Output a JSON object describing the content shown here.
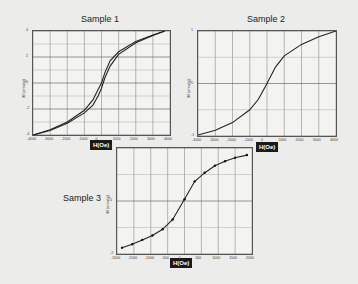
{
  "chart_data": [
    {
      "type": "line",
      "title": "Sample 1",
      "xlabel": "H(Oe)",
      "ylabel": "M (emu/g)",
      "xlim": [
        -4000,
        4000
      ],
      "ylim": [
        -4,
        4
      ],
      "xticks": [
        "-4000",
        "-3000",
        "-2000",
        "-1000",
        "0",
        "1000",
        "2000",
        "3000",
        "4000"
      ],
      "yticks": [
        "4",
        "2",
        "0",
        "-2",
        "-4"
      ],
      "grid": true,
      "series": [
        {
          "name": "ascending branch",
          "x": [
            -4000,
            -3000,
            -2000,
            -1000,
            -500,
            -200,
            0,
            200,
            500,
            1000,
            2000,
            3000,
            3700
          ],
          "y": [
            -4.0,
            -3.6,
            -3.0,
            -2.1,
            -1.3,
            -0.5,
            0.0,
            0.8,
            1.7,
            2.4,
            3.2,
            3.7,
            4.0
          ]
        },
        {
          "name": "descending branch",
          "x": [
            -4000,
            -3000,
            -2000,
            -1000,
            -500,
            -200,
            0,
            200,
            500,
            1000,
            2000,
            3000,
            3700
          ],
          "y": [
            -4.0,
            -3.65,
            -3.1,
            -2.3,
            -1.7,
            -1.0,
            -0.4,
            0.4,
            1.3,
            2.2,
            3.1,
            3.65,
            4.0
          ]
        }
      ]
    },
    {
      "type": "line",
      "title": "Sample 2",
      "xlabel": "H(Oe)",
      "ylabel": "M (emu/g)",
      "xlim": [
        -4000,
        4000
      ],
      "ylim": [
        -1.1,
        1.1
      ],
      "xticks": [
        "-4000",
        "-3000",
        "-2000",
        "-1000",
        "0",
        "1000",
        "2000",
        "3000",
        "4000"
      ],
      "yticks": [
        "1",
        "0",
        "-1"
      ],
      "grid": true,
      "series": [
        {
          "name": "M vs H",
          "x": [
            -4000,
            -3000,
            -2000,
            -1000,
            -500,
            0,
            500,
            1000,
            2000,
            3000,
            4000
          ],
          "y": [
            -1.08,
            -0.98,
            -0.82,
            -0.55,
            -0.33,
            0.0,
            0.35,
            0.58,
            0.82,
            0.98,
            1.1
          ]
        }
      ]
    },
    {
      "type": "line",
      "title": "Sample 3",
      "xlabel": "H(Oe)",
      "ylabel": "M (emu/g)",
      "xlim": [
        -2000,
        2000
      ],
      "ylim": [
        -3,
        3
      ],
      "xticks": [
        "-2000",
        "-1500",
        "-1000",
        "-500",
        "0",
        "500",
        "1000",
        "1500",
        "2000"
      ],
      "yticks": [
        "2",
        "0",
        "-2"
      ],
      "grid": true,
      "series": [
        {
          "name": "M vs H",
          "x": [
            -1850,
            -1550,
            -1250,
            -950,
            -650,
            -350,
            0,
            300,
            600,
            900,
            1200,
            1500,
            1850
          ],
          "y": [
            -2.65,
            -2.45,
            -2.2,
            -1.95,
            -1.6,
            -1.05,
            0.1,
            1.1,
            1.6,
            2.0,
            2.25,
            2.45,
            2.6
          ]
        }
      ]
    }
  ],
  "panels": [
    {
      "title": "Sample 1",
      "ylabel": "M (emu/g)",
      "xbadge": "H(Oe)",
      "xticks": [
        "-4000",
        "-3000",
        "-2000",
        "-1000",
        "0",
        "1000",
        "2000",
        "3000",
        "4000"
      ],
      "yticks": [
        "4",
        "2",
        "0",
        "-2",
        "-4"
      ]
    },
    {
      "title": "Sample 2",
      "ylabel": "M (emu/g)",
      "xbadge": "H(Oe)",
      "xticks": [
        "-4000",
        "-3000",
        "-2000",
        "-1000",
        "0",
        "1000",
        "2000",
        "3000",
        "4000"
      ],
      "yticks": [
        "1",
        "0",
        "-1"
      ]
    },
    {
      "title": "Sample 3",
      "ylabel": "M (emu/g)",
      "xbadge": "H(Oe)",
      "xticks": [
        "-2000",
        "-1500",
        "-1000",
        "-500",
        "0",
        "500",
        "1000",
        "1500",
        "2000"
      ],
      "yticks": [
        "2",
        "0",
        "-2"
      ]
    }
  ]
}
